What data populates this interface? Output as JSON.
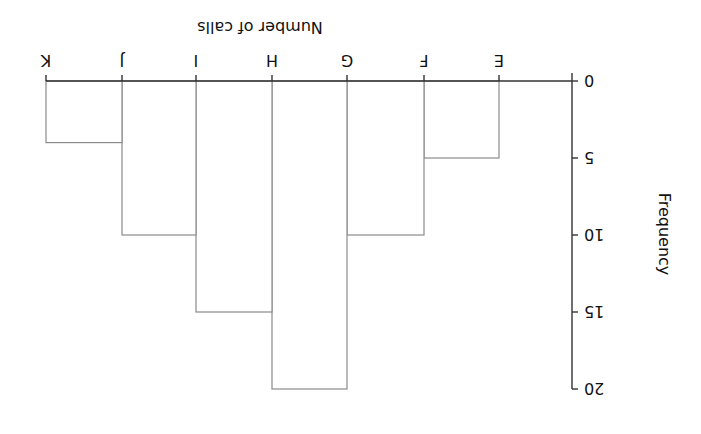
{
  "chart_data": {
    "type": "bar",
    "subtype": "histogram",
    "orientation_note": "figure displayed rotated 180 degrees",
    "title": "",
    "xlabel": "Number of calls",
    "ylabel": "Frequency",
    "boundaries": [
      "E",
      "F",
      "G",
      "H",
      "I",
      "J",
      "K"
    ],
    "categories": [
      "E–F",
      "F–G",
      "G–H",
      "H–I",
      "I–J",
      "J–K"
    ],
    "values": [
      5,
      10,
      20,
      15,
      10,
      4
    ],
    "yticks": [
      0,
      5,
      10,
      15,
      20
    ],
    "ylim": [
      0,
      20
    ],
    "grid": false,
    "legend": null
  },
  "colors": {
    "axis": "#333333",
    "bar_outline": "#8a8a8a",
    "bar_fill": "#ffffff",
    "text": "#111111"
  }
}
